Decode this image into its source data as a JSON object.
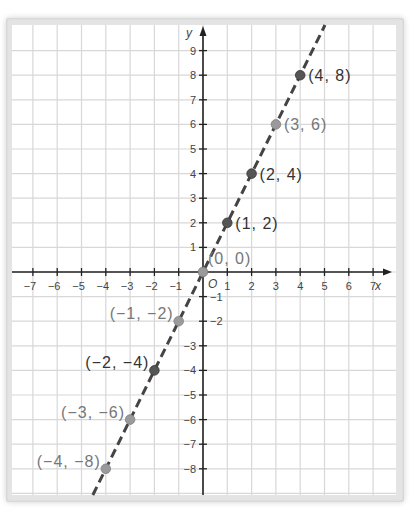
{
  "chart_data": {
    "type": "line",
    "title": "",
    "xlabel": "x",
    "ylabel": "y",
    "origin_label": "O",
    "xlim": [
      -7.8,
      7.8
    ],
    "ylim": [
      -9,
      10
    ],
    "x_ticks": [
      -7,
      -6,
      -5,
      -4,
      -3,
      -2,
      -1,
      1,
      2,
      3,
      4,
      5,
      6,
      7
    ],
    "y_ticks": [
      -8,
      -7,
      -6,
      -5,
      -4,
      -3,
      -2,
      -1,
      1,
      2,
      3,
      4,
      5,
      6,
      7,
      8,
      9
    ],
    "x_tick_labels": [
      "−7",
      "−6",
      "−5",
      "−4",
      "−3",
      "−2",
      "−1",
      "1",
      "2",
      "3",
      "4",
      "5",
      "6",
      "7"
    ],
    "y_tick_labels": [
      "−8",
      "−7",
      "−6",
      "−5",
      "−4",
      "−3",
      "−2",
      "−1",
      "1",
      "2",
      "3",
      "4",
      "5",
      "6",
      "7",
      "8",
      "9"
    ],
    "grid": true,
    "series": [
      {
        "name": "y = 2x",
        "style": "dashed",
        "color": "#444444",
        "x": [
          -4,
          -3,
          -2,
          -1,
          0,
          1,
          2,
          3,
          4
        ],
        "y": [
          -8,
          -6,
          -4,
          -2,
          0,
          2,
          4,
          6,
          8
        ]
      }
    ],
    "points": [
      {
        "x": 4,
        "y": 8,
        "label": "(4, 8)",
        "shade": "dark"
      },
      {
        "x": 3,
        "y": 6,
        "label": "(3, 6)",
        "shade": "light"
      },
      {
        "x": 2,
        "y": 4,
        "label": "(2, 4)",
        "shade": "dark"
      },
      {
        "x": 1,
        "y": 2,
        "label": "(1, 2)",
        "shade": "dark"
      },
      {
        "x": 0,
        "y": 0,
        "label": "(0, 0)",
        "shade": "light"
      },
      {
        "x": -1,
        "y": -2,
        "label": "(−1, −2)",
        "shade": "light"
      },
      {
        "x": -2,
        "y": -4,
        "label": "(−2, −4)",
        "shade": "dark"
      },
      {
        "x": -3,
        "y": -6,
        "label": "(−3, −6)",
        "shade": "light"
      },
      {
        "x": -4,
        "y": -8,
        "label": "(−4, −8)",
        "shade": "light"
      }
    ]
  },
  "colors": {
    "grid": "#d8d8d8",
    "axis": "#222222",
    "line": "#444444",
    "point_dark": "#555555",
    "point_light": "#9a9a9a",
    "label_dark": "#333333",
    "label_light": "#777777",
    "frame": "#e4e4e4",
    "plot_bg": "#ffffff"
  }
}
